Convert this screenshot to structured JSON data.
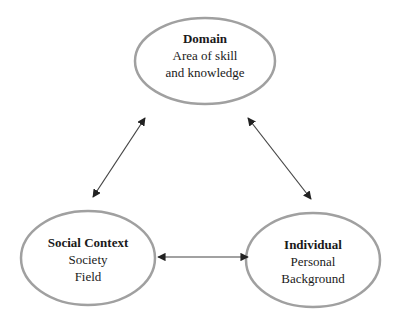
{
  "diagram": {
    "nodes": [
      {
        "id": "domain",
        "title": "Domain",
        "lines": [
          "Area of skill",
          "and knowledge"
        ]
      },
      {
        "id": "social",
        "title": "Social Context",
        "lines": [
          "Society",
          "Field"
        ]
      },
      {
        "id": "individual",
        "title": "Individual",
        "lines": [
          "Personal",
          "Background"
        ]
      }
    ],
    "edges": [
      {
        "from": "domain",
        "to": "social",
        "type": "bidirectional"
      },
      {
        "from": "domain",
        "to": "individual",
        "type": "bidirectional"
      },
      {
        "from": "social",
        "to": "individual",
        "type": "bidirectional"
      }
    ],
    "colors": {
      "ellipse_stroke": "#a0a0a0",
      "arrow": "#333333",
      "text": "#1a1a1a"
    }
  }
}
